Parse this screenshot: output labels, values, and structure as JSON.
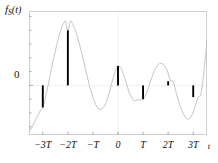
{
  "figure": {
    "ylabel_main": "f",
    "ylabel_sub": "S",
    "ylabel_arg": "(t)",
    "xaxis_name": "t",
    "ytick_zero": "0"
  },
  "chart_data": {
    "type": "line",
    "title": "",
    "subtitle": "",
    "xlabel": "t",
    "ylabel": "f_S(t)",
    "xlim": [
      -3.55,
      3.55
    ],
    "ylim": [
      -0.72,
      1.08
    ],
    "grid": true,
    "gridlines": {
      "vertical_at_x": [
        0
      ],
      "horizontal_at_y": [
        0
      ],
      "style": "dotted"
    },
    "legend": null,
    "legend_position": "none",
    "x_tick_values": [
      -3,
      -2,
      -1,
      0,
      1,
      2,
      3
    ],
    "x_tick_labels": [
      "−3T",
      "−2T",
      "−T",
      "0",
      "T",
      "2T",
      "3T"
    ],
    "y_tick_values": [
      0
    ],
    "y_tick_labels": [
      "0"
    ],
    "series": [
      {
        "name": "continuous signal f(t)",
        "type": "line",
        "color": "#b9b9b9",
        "x": [
          -3.55,
          -3.45,
          -3.35,
          -3.25,
          -3.15,
          -3.05,
          -3.0,
          -2.9,
          -2.8,
          -2.7,
          -2.6,
          -2.5,
          -2.4,
          -2.3,
          -2.2,
          -2.1,
          -2.0,
          -1.9,
          -1.8,
          -1.7,
          -1.6,
          -1.5,
          -1.4,
          -1.3,
          -1.2,
          -1.1,
          -1.0,
          -0.9,
          -0.8,
          -0.7,
          -0.6,
          -0.5,
          -0.4,
          -0.3,
          -0.2,
          -0.1,
          0.0,
          0.1,
          0.2,
          0.3,
          0.4,
          0.5,
          0.6,
          0.7,
          0.8,
          0.9,
          1.0,
          1.1,
          1.2,
          1.3,
          1.4,
          1.5,
          1.6,
          1.7,
          1.8,
          1.9,
          2.0,
          2.1,
          2.2,
          2.3,
          2.4,
          2.5,
          2.6,
          2.7,
          2.8,
          2.9,
          3.0,
          3.1,
          3.2,
          3.3,
          3.4,
          3.5,
          3.55
        ],
        "y": [
          -0.68,
          -0.62,
          -0.55,
          -0.47,
          -0.4,
          -0.34,
          -0.32,
          -0.18,
          -0.02,
          0.16,
          0.34,
          0.5,
          0.65,
          0.78,
          0.88,
          0.93,
          0.8,
          0.93,
          0.88,
          0.8,
          0.68,
          0.55,
          0.4,
          0.24,
          0.09,
          -0.05,
          -0.17,
          -0.27,
          -0.33,
          -0.35,
          -0.33,
          -0.27,
          -0.17,
          -0.04,
          0.1,
          0.21,
          0.28,
          0.26,
          0.18,
          0.07,
          -0.05,
          -0.15,
          -0.21,
          -0.22,
          -0.21,
          -0.21,
          -0.2,
          -0.14,
          -0.05,
          0.06,
          0.17,
          0.25,
          0.3,
          0.32,
          0.31,
          0.26,
          0.18,
          0.06,
          0.06,
          -0.08,
          -0.21,
          -0.32,
          -0.41,
          -0.47,
          -0.49,
          -0.46,
          -0.39,
          -0.28,
          -0.17,
          -0.13,
          0.11,
          0.46,
          0.66
        ]
      },
      {
        "name": "sampled impulses f_S(t)",
        "type": "stem",
        "color": "#000000",
        "x": [
          -3,
          -2,
          0,
          1,
          2,
          3
        ],
        "x_labels": [
          "−3T",
          "−2T",
          "0",
          "T",
          "2T",
          "3T"
        ],
        "y": [
          -0.32,
          0.8,
          0.28,
          -0.2,
          0.06,
          -0.17
        ],
        "baseline": 0
      }
    ],
    "annotations": []
  }
}
